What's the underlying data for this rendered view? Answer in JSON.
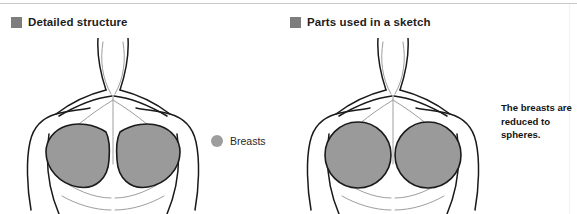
{
  "figure": {
    "width": 577,
    "height": 214,
    "background": "#ffffff",
    "top_rule_color": "#c9c9c9"
  },
  "panels": [
    {
      "id": "detailed-structure",
      "caption": "Detailed structure",
      "swatch_color": "#7d7d7d",
      "breast_shape": "teardrop",
      "breast_fill": "#9a9a9a",
      "outline_color": "#1a1a1a"
    },
    {
      "id": "parts-used-in-a-sketch",
      "caption": "Parts used in a sketch",
      "swatch_color": "#7d7d7d",
      "breast_shape": "sphere",
      "breast_fill": "#9a9a9a",
      "outline_color": "#1a1a1a"
    }
  ],
  "legend": {
    "label": "Breasts",
    "marker_color": "#9d9d9d",
    "marker_shape": "circle"
  },
  "annotation": {
    "text": "The breasts are\nreduced to spheres."
  },
  "icons": {
    "caption_marker": "filled-square-icon",
    "legend_marker": "filled-circle-icon"
  },
  "colors": {
    "outline": "#1a1a1a",
    "light_outline": "#b4b4b4",
    "breast_fill": "#9a9a9a",
    "swatch": "#7d7d7d",
    "legend_dot": "#9d9d9d",
    "rule": "#c9c9c9"
  }
}
